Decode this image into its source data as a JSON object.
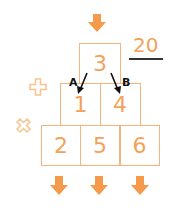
{
  "diagram": {
    "top_value": "3",
    "middle_row": [
      "1",
      "4"
    ],
    "bottom_row": [
      "2",
      "5",
      "6"
    ],
    "labels": {
      "a": "A",
      "b": "B"
    },
    "total": "20",
    "operators": {
      "add": "plus-icon",
      "multiply": "times-icon"
    },
    "colors": {
      "box_border": "#f6b57c",
      "number": "#f2a25a",
      "arrow": "#f59a4a",
      "operator": "#f8c48f",
      "label": "#111111",
      "underline": "#333333"
    }
  }
}
